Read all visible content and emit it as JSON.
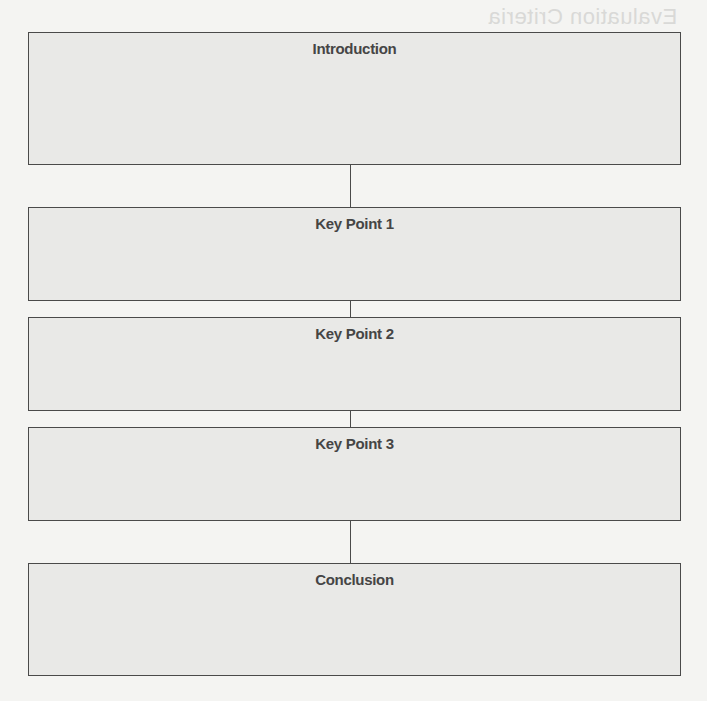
{
  "page": {
    "background_show_through": "Evaluation Criteria"
  },
  "flowchart": {
    "boxes": [
      {
        "id": "introduction",
        "title": "Introduction"
      },
      {
        "id": "key-point-1",
        "title": "Key Point 1"
      },
      {
        "id": "key-point-2",
        "title": "Key Point 2"
      },
      {
        "id": "key-point-3",
        "title": "Key Point 3"
      },
      {
        "id": "conclusion",
        "title": "Conclusion"
      }
    ]
  },
  "colors": {
    "page_background": "#f4f4f2",
    "box_fill": "#e9e9e7",
    "border": "#4a4a4a",
    "title_text": "#454545"
  }
}
